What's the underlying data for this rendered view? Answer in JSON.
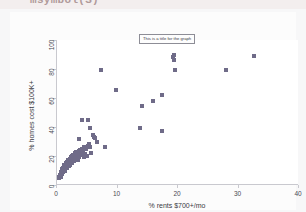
{
  "header": {
    "code_text": "msymbol(S)"
  },
  "chart_data": {
    "type": "scatter",
    "title": "This is a title for the graph",
    "xlabel": "% rents $700+/mo",
    "ylabel": "% homes cost $100K+",
    "xlim": [
      0,
      40
    ],
    "ylim": [
      0,
      100
    ],
    "xticks": [
      0,
      10,
      20,
      30,
      40
    ],
    "yticks": [
      0,
      20,
      40,
      60,
      80,
      100
    ],
    "grid": false,
    "legend": null,
    "marker_color": "#6f6b88",
    "marker_shape": "square",
    "points": [
      [
        0.3,
        4.5
      ],
      [
        0.4,
        5.2
      ],
      [
        0.5,
        6.0
      ],
      [
        0.5,
        7.1
      ],
      [
        0.6,
        5.8
      ],
      [
        0.6,
        8.0
      ],
      [
        0.7,
        6.5
      ],
      [
        0.7,
        9.0
      ],
      [
        0.8,
        7.5
      ],
      [
        0.8,
        10.0
      ],
      [
        0.9,
        8.2
      ],
      [
        0.9,
        11.0
      ],
      [
        1.0,
        9.0
      ],
      [
        1.0,
        12.0
      ],
      [
        1.1,
        10.5
      ],
      [
        1.1,
        13.0
      ],
      [
        1.2,
        11.0
      ],
      [
        1.2,
        14.0
      ],
      [
        1.3,
        12.0
      ],
      [
        1.3,
        9.5
      ],
      [
        1.4,
        13.5
      ],
      [
        1.4,
        10.8
      ],
      [
        1.5,
        12.5
      ],
      [
        1.5,
        15.0
      ],
      [
        1.6,
        13.0
      ],
      [
        1.6,
        11.5
      ],
      [
        1.7,
        14.5
      ],
      [
        1.7,
        16.0
      ],
      [
        1.8,
        12.8
      ],
      [
        1.8,
        15.5
      ],
      [
        1.9,
        14.0
      ],
      [
        1.9,
        17.0
      ],
      [
        2.0,
        15.0
      ],
      [
        2.0,
        13.2
      ],
      [
        2.1,
        16.5
      ],
      [
        2.1,
        18.0
      ],
      [
        2.2,
        15.8
      ],
      [
        2.2,
        14.0
      ],
      [
        2.3,
        17.5
      ],
      [
        2.3,
        19.0
      ],
      [
        2.4,
        16.0
      ],
      [
        2.4,
        20.0
      ],
      [
        2.5,
        18.5
      ],
      [
        2.5,
        15.2
      ],
      [
        2.6,
        19.5
      ],
      [
        2.6,
        17.0
      ],
      [
        2.7,
        20.5
      ],
      [
        2.7,
        18.0
      ],
      [
        2.8,
        21.0
      ],
      [
        2.8,
        16.8
      ],
      [
        2.9,
        19.8
      ],
      [
        2.9,
        22.0
      ],
      [
        3.0,
        20.2
      ],
      [
        3.0,
        18.5
      ],
      [
        3.1,
        21.5
      ],
      [
        3.2,
        19.0
      ],
      [
        3.2,
        23.0
      ],
      [
        3.3,
        20.8
      ],
      [
        3.4,
        22.5
      ],
      [
        3.4,
        17.5
      ],
      [
        3.5,
        21.0
      ],
      [
        3.6,
        23.5
      ],
      [
        3.6,
        32.0
      ],
      [
        3.7,
        19.5
      ],
      [
        3.8,
        24.0
      ],
      [
        3.9,
        22.0
      ],
      [
        4.0,
        20.5
      ],
      [
        4.1,
        25.0
      ],
      [
        4.2,
        44.5
      ],
      [
        4.3,
        23.0
      ],
      [
        4.4,
        19.5
      ],
      [
        4.5,
        26.0
      ],
      [
        4.6,
        21.5
      ],
      [
        4.8,
        24.5
      ],
      [
        5.0,
        19.8
      ],
      [
        5.1,
        27.0
      ],
      [
        5.2,
        45.0
      ],
      [
        5.3,
        28.0
      ],
      [
        5.4,
        26.5
      ],
      [
        5.5,
        39.0
      ],
      [
        5.7,
        22.0
      ],
      [
        5.9,
        34.5
      ],
      [
        6.1,
        33.0
      ],
      [
        6.3,
        32.5
      ],
      [
        6.6,
        30.0
      ],
      [
        7.2,
        79.5
      ],
      [
        7.9,
        26.5
      ],
      [
        9.8,
        65.5
      ],
      [
        13.8,
        39.5
      ],
      [
        14.1,
        54.5
      ],
      [
        15.9,
        58.0
      ],
      [
        17.3,
        62.0
      ],
      [
        17.4,
        37.0
      ],
      [
        19.1,
        88.0
      ],
      [
        19.3,
        90.0
      ],
      [
        19.4,
        86.5
      ],
      [
        19.5,
        79.5
      ],
      [
        27.9,
        79.0
      ],
      [
        32.5,
        89.0
      ]
    ]
  }
}
